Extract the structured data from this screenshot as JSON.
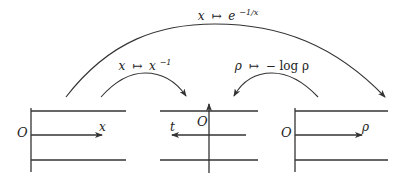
{
  "diagram": {
    "type": "coordinate-transformation-diagram",
    "panels": [
      {
        "id": "left",
        "origin_label": "O",
        "axis_label": "x",
        "axis_direction": "right"
      },
      {
        "id": "middle",
        "origin_label": "O",
        "axis_label": "t",
        "axis_direction": "left",
        "has_vertical_axis_arrow": true
      },
      {
        "id": "right",
        "origin_label": "O",
        "axis_label": "ρ",
        "axis_direction": "right"
      }
    ],
    "maps": [
      {
        "id": "outer",
        "from": "left",
        "to": "right",
        "label_var": "x",
        "label_maps": "↦",
        "label_base": "e",
        "label_exp": "−1/x"
      },
      {
        "id": "inner-left",
        "from": "left",
        "to": "middle",
        "label_var": "x",
        "label_maps": "↦",
        "label_base": "x",
        "label_exp": "−1"
      },
      {
        "id": "inner-right",
        "from": "right",
        "to": "middle",
        "label_var": "ρ",
        "label_maps": "↦",
        "label_body": "− log ρ"
      }
    ]
  },
  "colors": {
    "stroke": "#333333",
    "background": "#ffffff",
    "text": "#222222"
  }
}
